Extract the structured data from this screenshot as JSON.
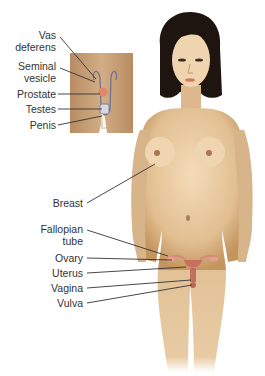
{
  "male_labels": [
    {
      "id": "vas-deferens",
      "lines": [
        "Vas",
        "deferens"
      ]
    },
    {
      "id": "seminal-vesicle",
      "lines": [
        "Seminal",
        "vesicle"
      ]
    },
    {
      "id": "prostate",
      "lines": [
        "Prostate"
      ]
    },
    {
      "id": "testes",
      "lines": [
        "Testes"
      ]
    },
    {
      "id": "penis",
      "lines": [
        "Penis"
      ]
    }
  ],
  "female_labels": [
    {
      "id": "breast",
      "lines": [
        "Breast"
      ]
    },
    {
      "id": "fallopian-tube",
      "lines": [
        "Fallopian",
        "tube"
      ]
    },
    {
      "id": "ovary",
      "lines": [
        "Ovary"
      ]
    },
    {
      "id": "uterus",
      "lines": [
        "Uterus"
      ]
    },
    {
      "id": "vagina",
      "lines": [
        "Vagina"
      ]
    },
    {
      "id": "vulva",
      "lines": [
        "Vulva"
      ]
    }
  ],
  "colors": {
    "skin": "#e8c9a0",
    "skin_shadow": "#c99a66",
    "hair": "#1e1410",
    "inset_bg": "#c7a078",
    "organ_pink": "#d98a7a",
    "prostate": "#e0866a",
    "leader_line": "#333333",
    "text": "#333333"
  }
}
